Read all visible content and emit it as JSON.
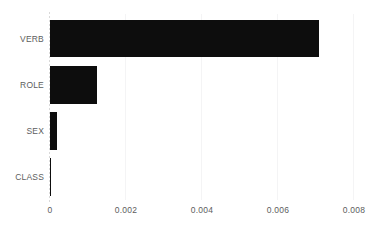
{
  "chart_data": {
    "type": "bar",
    "orientation": "horizontal",
    "title": "",
    "subtitle": "",
    "xlabel": "",
    "ylabel": "",
    "categories": [
      "VERB",
      "ROLE",
      "SEX",
      "CLASS"
    ],
    "values": [
      0.0071,
      0.00125,
      0.0002,
      5e-05
    ],
    "series": [
      {
        "name": "",
        "values": [
          0.0071,
          0.00125,
          0.0002,
          5e-05
        ]
      }
    ],
    "xlim": [
      0,
      0.008
    ],
    "xticks": [
      0,
      0.002,
      0.004,
      0.006,
      0.008
    ],
    "xtick_labels": [
      "0",
      "0.002",
      "0.004",
      "0.006",
      "0.008"
    ],
    "ytick_labels": [
      "VERB",
      "ROLE",
      "SEX",
      "CLASS"
    ],
    "grid": "vertical",
    "legend": false,
    "legend_position": "none",
    "bar_color": "#0d0d0d",
    "grid_color": "#f4f4f5",
    "axis_color": "#d9d9d9",
    "tick_label_color": "#5d5d5d",
    "background_color": "#ffffff"
  }
}
